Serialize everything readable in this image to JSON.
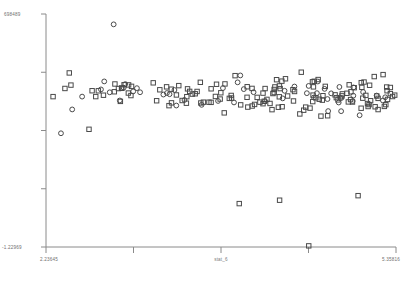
{
  "chart_data": {
    "type": "scatter",
    "title": "",
    "xlabel": "stat_6",
    "ylabel": "",
    "xlim": [
      2.23645,
      5.35816
    ],
    "ylim": [
      -1.22969,
      6.98489
    ],
    "grid": false,
    "legend": null,
    "xticklabels": [
      "2.23645",
      "",
      "",
      "",
      "5.35816"
    ],
    "yticklabels": [
      "698489",
      "",
      "",
      "",
      "-1.22969"
    ],
    "xtick_values": [
      2.23645,
      3.01688,
      3.79731,
      4.57773,
      5.35816
    ],
    "ytick_values": [
      6.98489,
      4.93109,
      2.87729,
      0.82349,
      -1.22969
    ],
    "y_axis_top_label": "698489",
    "y_axis_bottom_label": "-1.22969",
    "x_axis_left_label": "2.23645",
    "x_axis_right_label": "5.35816",
    "marker_shapes": [
      "square",
      "circle"
    ],
    "marker_color": "#4a4a4a",
    "n_points": 191,
    "series": [
      {
        "name": "observations",
        "marker": "mixed",
        "points": [
          [
            3.016,
            6.52,
            "circle"
          ],
          [
            2.52,
            3.69,
            "circle"
          ],
          [
            2.72,
            3.37,
            "square"
          ],
          [
            2.98,
            4.09,
            "square"
          ],
          [
            3.1,
            4.71,
            "square"
          ],
          [
            3.21,
            4.42,
            "square"
          ],
          [
            3.15,
            3.98,
            "square"
          ],
          [
            3.32,
            4.55,
            "circle"
          ],
          [
            3.28,
            4.18,
            "square"
          ],
          [
            3.4,
            4.62,
            "square"
          ],
          [
            3.36,
            3.12,
            "square"
          ],
          [
            3.02,
            2.88,
            "square"
          ],
          [
            3.24,
            2.52,
            "square"
          ],
          [
            3.48,
            4.38,
            "square"
          ],
          [
            3.55,
            4.72,
            "circle"
          ],
          [
            3.5,
            4.02,
            "square"
          ],
          [
            3.62,
            4.48,
            "square"
          ],
          [
            3.58,
            3.66,
            "square"
          ],
          [
            3.7,
            4.58,
            "circle"
          ],
          [
            3.66,
            4.12,
            "square"
          ],
          [
            3.74,
            3.88,
            "square"
          ],
          [
            3.8,
            4.66,
            "square"
          ],
          [
            3.78,
            4.28,
            "circle"
          ],
          [
            3.86,
            4.45,
            "square"
          ],
          [
            3.84,
            3.78,
            "square"
          ],
          [
            3.9,
            4.7,
            "square"
          ],
          [
            3.94,
            4.32,
            "circle"
          ],
          [
            3.98,
            4.55,
            "square"
          ],
          [
            3.92,
            3.92,
            "square"
          ],
          [
            4.04,
            4.62,
            "circle"
          ],
          [
            4.02,
            4.22,
            "square"
          ],
          [
            4.08,
            4.48,
            "square"
          ],
          [
            4.06,
            3.85,
            "square"
          ],
          [
            4.12,
            4.68,
            "circle"
          ],
          [
            4.16,
            4.35,
            "square"
          ],
          [
            4.14,
            4.05,
            "square"
          ],
          [
            4.2,
            4.58,
            "square"
          ],
          [
            4.18,
            4.25,
            "circle"
          ],
          [
            4.24,
            4.44,
            "square"
          ],
          [
            4.22,
            3.95,
            "square"
          ],
          [
            4.28,
            4.64,
            "circle"
          ],
          [
            4.26,
            4.15,
            "square"
          ],
          [
            4.32,
            4.5,
            "square"
          ],
          [
            4.3,
            4.3,
            "circle"
          ],
          [
            4.36,
            4.6,
            "square"
          ],
          [
            4.34,
            4.08,
            "square"
          ],
          [
            4.4,
            4.46,
            "circle"
          ],
          [
            4.38,
            4.2,
            "square"
          ],
          [
            4.44,
            4.56,
            "square"
          ],
          [
            4.42,
            3.9,
            "square"
          ],
          [
            4.48,
            4.66,
            "circle"
          ],
          [
            4.46,
            4.28,
            "square"
          ],
          [
            4.52,
            4.42,
            "square"
          ],
          [
            4.5,
            4.02,
            "circle"
          ],
          [
            4.56,
            4.54,
            "square"
          ],
          [
            4.54,
            4.18,
            "square"
          ],
          [
            4.6,
            4.62,
            "circle"
          ],
          [
            4.58,
            4.32,
            "square"
          ],
          [
            4.64,
            4.48,
            "square"
          ],
          [
            4.62,
            3.98,
            "square"
          ],
          [
            4.68,
            4.58,
            "circle"
          ],
          [
            4.66,
            4.22,
            "square"
          ],
          [
            4.72,
            4.44,
            "square"
          ],
          [
            4.7,
            4.1,
            "circle"
          ],
          [
            4.76,
            4.6,
            "square"
          ],
          [
            4.74,
            4.26,
            "square"
          ],
          [
            4.8,
            4.5,
            "circle"
          ],
          [
            4.78,
            4.04,
            "square"
          ],
          [
            4.84,
            4.64,
            "square"
          ],
          [
            4.82,
            4.3,
            "square"
          ],
          [
            4.88,
            4.46,
            "circle"
          ],
          [
            4.86,
            4.14,
            "square"
          ],
          [
            4.92,
            4.56,
            "square"
          ],
          [
            4.9,
            4.24,
            "circle"
          ],
          [
            4.96,
            4.4,
            "square"
          ],
          [
            4.94,
            3.96,
            "square"
          ],
          [
            5.0,
            4.62,
            "circle"
          ],
          [
            4.98,
            4.2,
            "square"
          ],
          [
            5.04,
            4.48,
            "square"
          ],
          [
            5.02,
            4.08,
            "circle"
          ],
          [
            5.08,
            4.58,
            "square"
          ],
          [
            5.06,
            4.32,
            "square"
          ],
          [
            5.12,
            4.44,
            "circle"
          ],
          [
            5.1,
            4.16,
            "square"
          ],
          [
            5.16,
            4.54,
            "square"
          ],
          [
            5.14,
            4.0,
            "square"
          ],
          [
            5.2,
            4.66,
            "circle"
          ],
          [
            5.18,
            4.28,
            "square"
          ],
          [
            5.24,
            4.42,
            "square"
          ],
          [
            5.22,
            4.12,
            "circle"
          ],
          [
            5.28,
            4.52,
            "square"
          ],
          [
            5.26,
            4.22,
            "square"
          ],
          [
            5.3,
            4.36,
            "circle"
          ],
          [
            5.32,
            4.6,
            "square"
          ],
          [
            5.34,
            4.1,
            "square"
          ],
          [
            5.35,
            4.48,
            "square"
          ]
        ]
      }
    ]
  }
}
